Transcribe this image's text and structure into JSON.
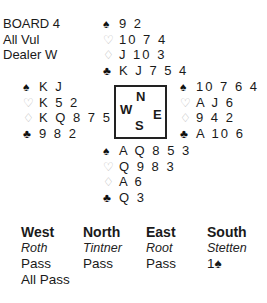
{
  "board_info": {
    "board": "BOARD 4",
    "vulnerability": "All Vul",
    "dealer": "Dealer W"
  },
  "suit_icons": {
    "spades": "♠",
    "hearts": "♡",
    "diamonds": "♢",
    "clubs": "♣"
  },
  "colors": {
    "black_suit": "#111111",
    "red_suit_outline": "#b8b8b8",
    "text": "#1a1a1a"
  },
  "hands": {
    "north": {
      "spades": "9 2",
      "hearts": "10 7 4",
      "diamonds": "J 10 3",
      "clubs": "K J 7 5 4"
    },
    "west": {
      "spades": "K J",
      "hearts": "K 5 2",
      "diamonds": "K Q 8 7 5",
      "clubs": "9 8 2"
    },
    "east": {
      "spades": "10 7 6 4",
      "hearts": "A J 6",
      "diamonds": "9 4 2",
      "clubs": "A 10 6"
    },
    "south": {
      "spades": "A Q 8 5 3",
      "hearts": "Q 9 8 3",
      "diamonds": "A 6",
      "clubs": "Q 3"
    }
  },
  "compass": {
    "north": "N",
    "west": "W",
    "east": "E",
    "south": "S"
  },
  "auction": {
    "columns": [
      {
        "seat": "West",
        "player": "Roth",
        "bids": [
          "Pass",
          "All Pass"
        ]
      },
      {
        "seat": "North",
        "player": "Tintner",
        "bids": [
          "Pass"
        ]
      },
      {
        "seat": "East",
        "player": "Root",
        "bids": [
          "Pass"
        ]
      },
      {
        "seat": "South",
        "player": "Stetten",
        "bids": [
          "1♠"
        ]
      }
    ]
  }
}
